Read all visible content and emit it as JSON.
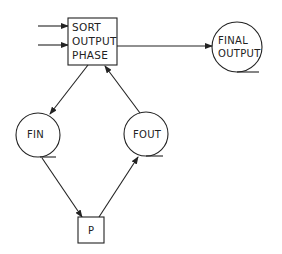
{
  "diagram": {
    "type": "flow-diagram",
    "nodes": [
      {
        "id": "sort",
        "shape": "box",
        "lines": [
          "SORT",
          "OUTPUT",
          "PHASE"
        ]
      },
      {
        "id": "final",
        "shape": "tape-circle",
        "lines": [
          "FINAL",
          "OUTPUT"
        ]
      },
      {
        "id": "fin",
        "shape": "tape-circle",
        "lines": [
          "FIN"
        ]
      },
      {
        "id": "fout",
        "shape": "tape-circle",
        "lines": [
          "FOUT"
        ]
      },
      {
        "id": "p",
        "shape": "box",
        "lines": [
          "P"
        ]
      }
    ],
    "edges": [
      {
        "from": "input-1",
        "to": "sort",
        "arrow": true
      },
      {
        "from": "input-2",
        "to": "sort",
        "arrow": true
      },
      {
        "from": "sort",
        "to": "final",
        "arrow": true
      },
      {
        "from": "sort",
        "to": "fin",
        "arrow": true
      },
      {
        "from": "fin",
        "to": "p",
        "arrow": true
      },
      {
        "from": "p",
        "to": "fout",
        "arrow": true
      },
      {
        "from": "fout",
        "to": "sort",
        "arrow": true
      }
    ]
  }
}
